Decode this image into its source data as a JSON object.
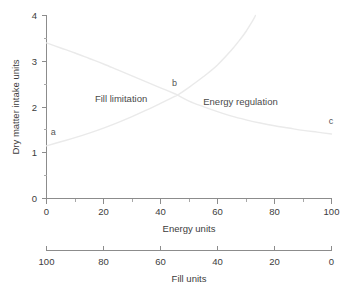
{
  "chart_data": {
    "type": "line",
    "title": "",
    "xlabel": "Energy units",
    "ylabel": "Dry matter intake units",
    "xlim": [
      0,
      100
    ],
    "ylim": [
      0,
      4
    ],
    "grid": false,
    "legend_position": "none",
    "x_ticks": [
      0,
      20,
      40,
      60,
      80,
      100
    ],
    "x_tick_labels": [
      "0",
      "20",
      "40",
      "60",
      "80",
      "100"
    ],
    "x_minor_ticks": [
      10,
      30,
      50,
      70,
      90
    ],
    "y_ticks": [
      0,
      1,
      2,
      3,
      4
    ],
    "y_tick_labels": [
      "0",
      "1",
      "2",
      "3",
      "4"
    ],
    "y_minor_ticks": [
      0.5,
      1.5,
      2.5,
      3.5
    ],
    "secondary_axis": {
      "label": "Fill units",
      "lim": [
        100,
        0
      ],
      "ticks": [
        100,
        80,
        60,
        40,
        20,
        0
      ],
      "tick_labels": [
        "100",
        "80",
        "60",
        "40",
        "20",
        "0"
      ],
      "reversed": true
    },
    "series": [
      {
        "name": "Fill limitation capacity",
        "color": "#eaeaea",
        "points": [
          [
            0,
            3.4
          ],
          [
            5,
            3.29
          ],
          [
            10,
            3.18
          ],
          [
            15,
            3.06
          ],
          [
            20,
            2.94
          ],
          [
            25,
            2.81
          ],
          [
            30,
            2.68
          ],
          [
            35,
            2.55
          ],
          [
            40,
            2.42
          ],
          [
            45,
            2.29
          ],
          [
            46,
            2.26
          ],
          [
            50,
            2.13
          ],
          [
            55,
            2.01
          ],
          [
            60,
            1.9
          ],
          [
            65,
            1.8
          ],
          [
            70,
            1.72
          ],
          [
            75,
            1.65
          ],
          [
            80,
            1.59
          ],
          [
            85,
            1.54
          ],
          [
            90,
            1.49
          ],
          [
            95,
            1.45
          ],
          [
            100,
            1.41
          ]
        ]
      },
      {
        "name": "Energy requirement intake",
        "color": "#eaeaea",
        "points": [
          [
            0,
            1.15
          ],
          [
            5,
            1.24
          ],
          [
            10,
            1.33
          ],
          [
            15,
            1.43
          ],
          [
            20,
            1.54
          ],
          [
            25,
            1.66
          ],
          [
            30,
            1.79
          ],
          [
            35,
            1.93
          ],
          [
            40,
            2.08
          ],
          [
            45,
            2.23
          ],
          [
            46,
            2.26
          ],
          [
            50,
            2.43
          ],
          [
            55,
            2.66
          ],
          [
            60,
            2.92
          ],
          [
            65,
            3.25
          ],
          [
            68,
            3.48
          ],
          [
            70,
            3.65
          ],
          [
            72,
            3.85
          ],
          [
            73,
            3.96
          ],
          [
            73.3,
            4.0
          ]
        ]
      }
    ],
    "annotations": [
      {
        "text": "Fill limitation",
        "x": 17,
        "y": 2.12,
        "name": "fill-limitation-label"
      },
      {
        "text": "Energy regulation",
        "x": 55,
        "y": 2.05,
        "name": "energy-regulation-label"
      },
      {
        "text": "a",
        "x": 1.5,
        "y": 1.38,
        "name": "point-a-label"
      },
      {
        "text": "b",
        "x": 44,
        "y": 2.46,
        "name": "point-b-label"
      },
      {
        "text": "c",
        "x": 99,
        "y": 1.62,
        "name": "point-c-label"
      }
    ]
  }
}
